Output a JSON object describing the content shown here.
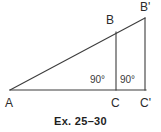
{
  "figure": {
    "caption": "Ex. 25–30",
    "background_color": "#ffffff",
    "stroke_color": "#3c3c3c",
    "label_color": "#2b2b2b",
    "caption_color": "#1e1e1e",
    "width": 161,
    "height": 132
  },
  "labels": {
    "a": "A",
    "b": "B",
    "b_prime": "B'",
    "c": "C",
    "c_prime": "C'",
    "angle_c": "90°",
    "angle_c_prime": "90°"
  },
  "geometry": {
    "description": "Two nested right triangles sharing vertex A and a common hypotenuse ray; right angles at C and C' on the horizontal base.",
    "points": {
      "A": [
        10,
        90
      ],
      "B": [
        116,
        32
      ],
      "B_prime": [
        145,
        18
      ],
      "C": [
        116,
        90
      ],
      "C_prime": [
        145,
        90
      ]
    },
    "segments": [
      {
        "name": "base-A-to-Cprime",
        "from": "A",
        "to": "C_prime"
      },
      {
        "name": "hypotenuse-A-to-Bprime",
        "from": "A",
        "to": "B_prime"
      },
      {
        "name": "leg-B-to-C",
        "from": "B",
        "to": "C"
      },
      {
        "name": "leg-Bprime-to-Cprime",
        "from": "B_prime",
        "to": "C_prime"
      }
    ]
  }
}
